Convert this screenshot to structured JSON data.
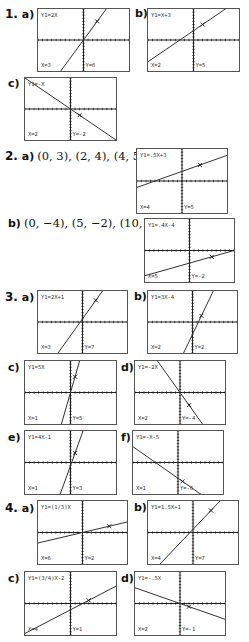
{
  "problems": [
    {
      "number": "1.",
      "parts": [
        {
          "id": "1a",
          "label": "a)",
          "equation": "Y1=2X",
          "x_value": "X=3",
          "y_value": "Y=6",
          "slope": 2,
          "intercept": 0,
          "trace_x": 3
        },
        {
          "id": "1b",
          "label": "b)",
          "equation": "Y1=X+3",
          "x_value": "X=2",
          "y_value": "Y=5",
          "slope": 1,
          "intercept": 3,
          "trace_x": 2
        },
        {
          "id": "1c",
          "label": "c)",
          "equation": "Y1=-X",
          "x_value": "X=2",
          "y_value": "Y=-2",
          "slope": -1,
          "intercept": 0,
          "trace_x": 2
        }
      ]
    },
    {
      "number": "2.",
      "parts": [
        {
          "id": "2a",
          "label": "a)",
          "points_text": "(0, 3), (2, 4), (4, 5)",
          "equation": "Y1=.5X+3",
          "x_value": "X=4",
          "y_value": "Y=5",
          "slope": 0.5,
          "intercept": 3,
          "trace_x": 4
        },
        {
          "id": "2b",
          "label": "b)",
          "points_text": "(0, −4), (5, −2), (10, 0)",
          "equation": "Y1=.4X-4",
          "x_value": "X=5",
          "y_value": "Y=-2",
          "slope": 0.4,
          "intercept": -4,
          "trace_x": 5
        }
      ]
    },
    {
      "number": "3.",
      "parts": [
        {
          "id": "3a",
          "label": "a)",
          "equation": "Y1=2X+1",
          "x_value": "X=3",
          "y_value": "Y=7",
          "slope": 2,
          "intercept": 1,
          "trace_x": 3
        },
        {
          "id": "3b",
          "label": "b)",
          "equation": "Y1=3X-4",
          "x_value": "X=2",
          "y_value": "Y=2",
          "slope": 3,
          "intercept": -4,
          "trace_x": 2
        },
        {
          "id": "3c",
          "label": "c)",
          "equation": "Y1=5X",
          "x_value": "X=1",
          "y_value": "Y=5",
          "slope": 5,
          "intercept": 0,
          "trace_x": 1
        },
        {
          "id": "3d",
          "label": "d)",
          "equation": "Y1=-2X",
          "x_value": "X=2",
          "y_value": "Y=-4",
          "slope": -2,
          "intercept": 0,
          "trace_x": 2
        },
        {
          "id": "3e",
          "label": "e)",
          "equation": "Y1=4X-1",
          "x_value": "X=1",
          "y_value": "Y=3",
          "slope": 4,
          "intercept": -1,
          "trace_x": 1
        },
        {
          "id": "3f",
          "label": "f)",
          "equation": "Y1=-X-5",
          "x_value": "X=1",
          "y_value": "Y=-6",
          "slope": -1,
          "intercept": -5,
          "trace_x": 1
        }
      ]
    },
    {
      "number": "4.",
      "parts": [
        {
          "id": "4a",
          "label": "a)",
          "equation": "Y1=(1/3)X",
          "x_value": "X=6",
          "y_value": "Y=2",
          "slope": 0.3333,
          "intercept": 0,
          "trace_x": 6
        },
        {
          "id": "4b",
          "label": "b)",
          "equation": "Y1=1.5X+1",
          "x_value": "X=4",
          "y_value": "Y=7",
          "slope": 1.5,
          "intercept": 1,
          "trace_x": 4
        },
        {
          "id": "4c",
          "label": "c)",
          "equation": "Y1=(3/4)X-2",
          "x_value": "X=4",
          "y_value": "Y=1",
          "slope": 0.75,
          "intercept": -2,
          "trace_x": 4
        },
        {
          "id": "4d",
          "label": "d)",
          "equation": "Y1=-.5X",
          "x_value": "X=2",
          "y_value": "Y=-1",
          "slope": -0.5,
          "intercept": 0,
          "trace_x": 2
        }
      ]
    }
  ],
  "colors": {
    "axis": "#222222",
    "line": "#333333",
    "border": "#555555",
    "text": "#111111"
  }
}
